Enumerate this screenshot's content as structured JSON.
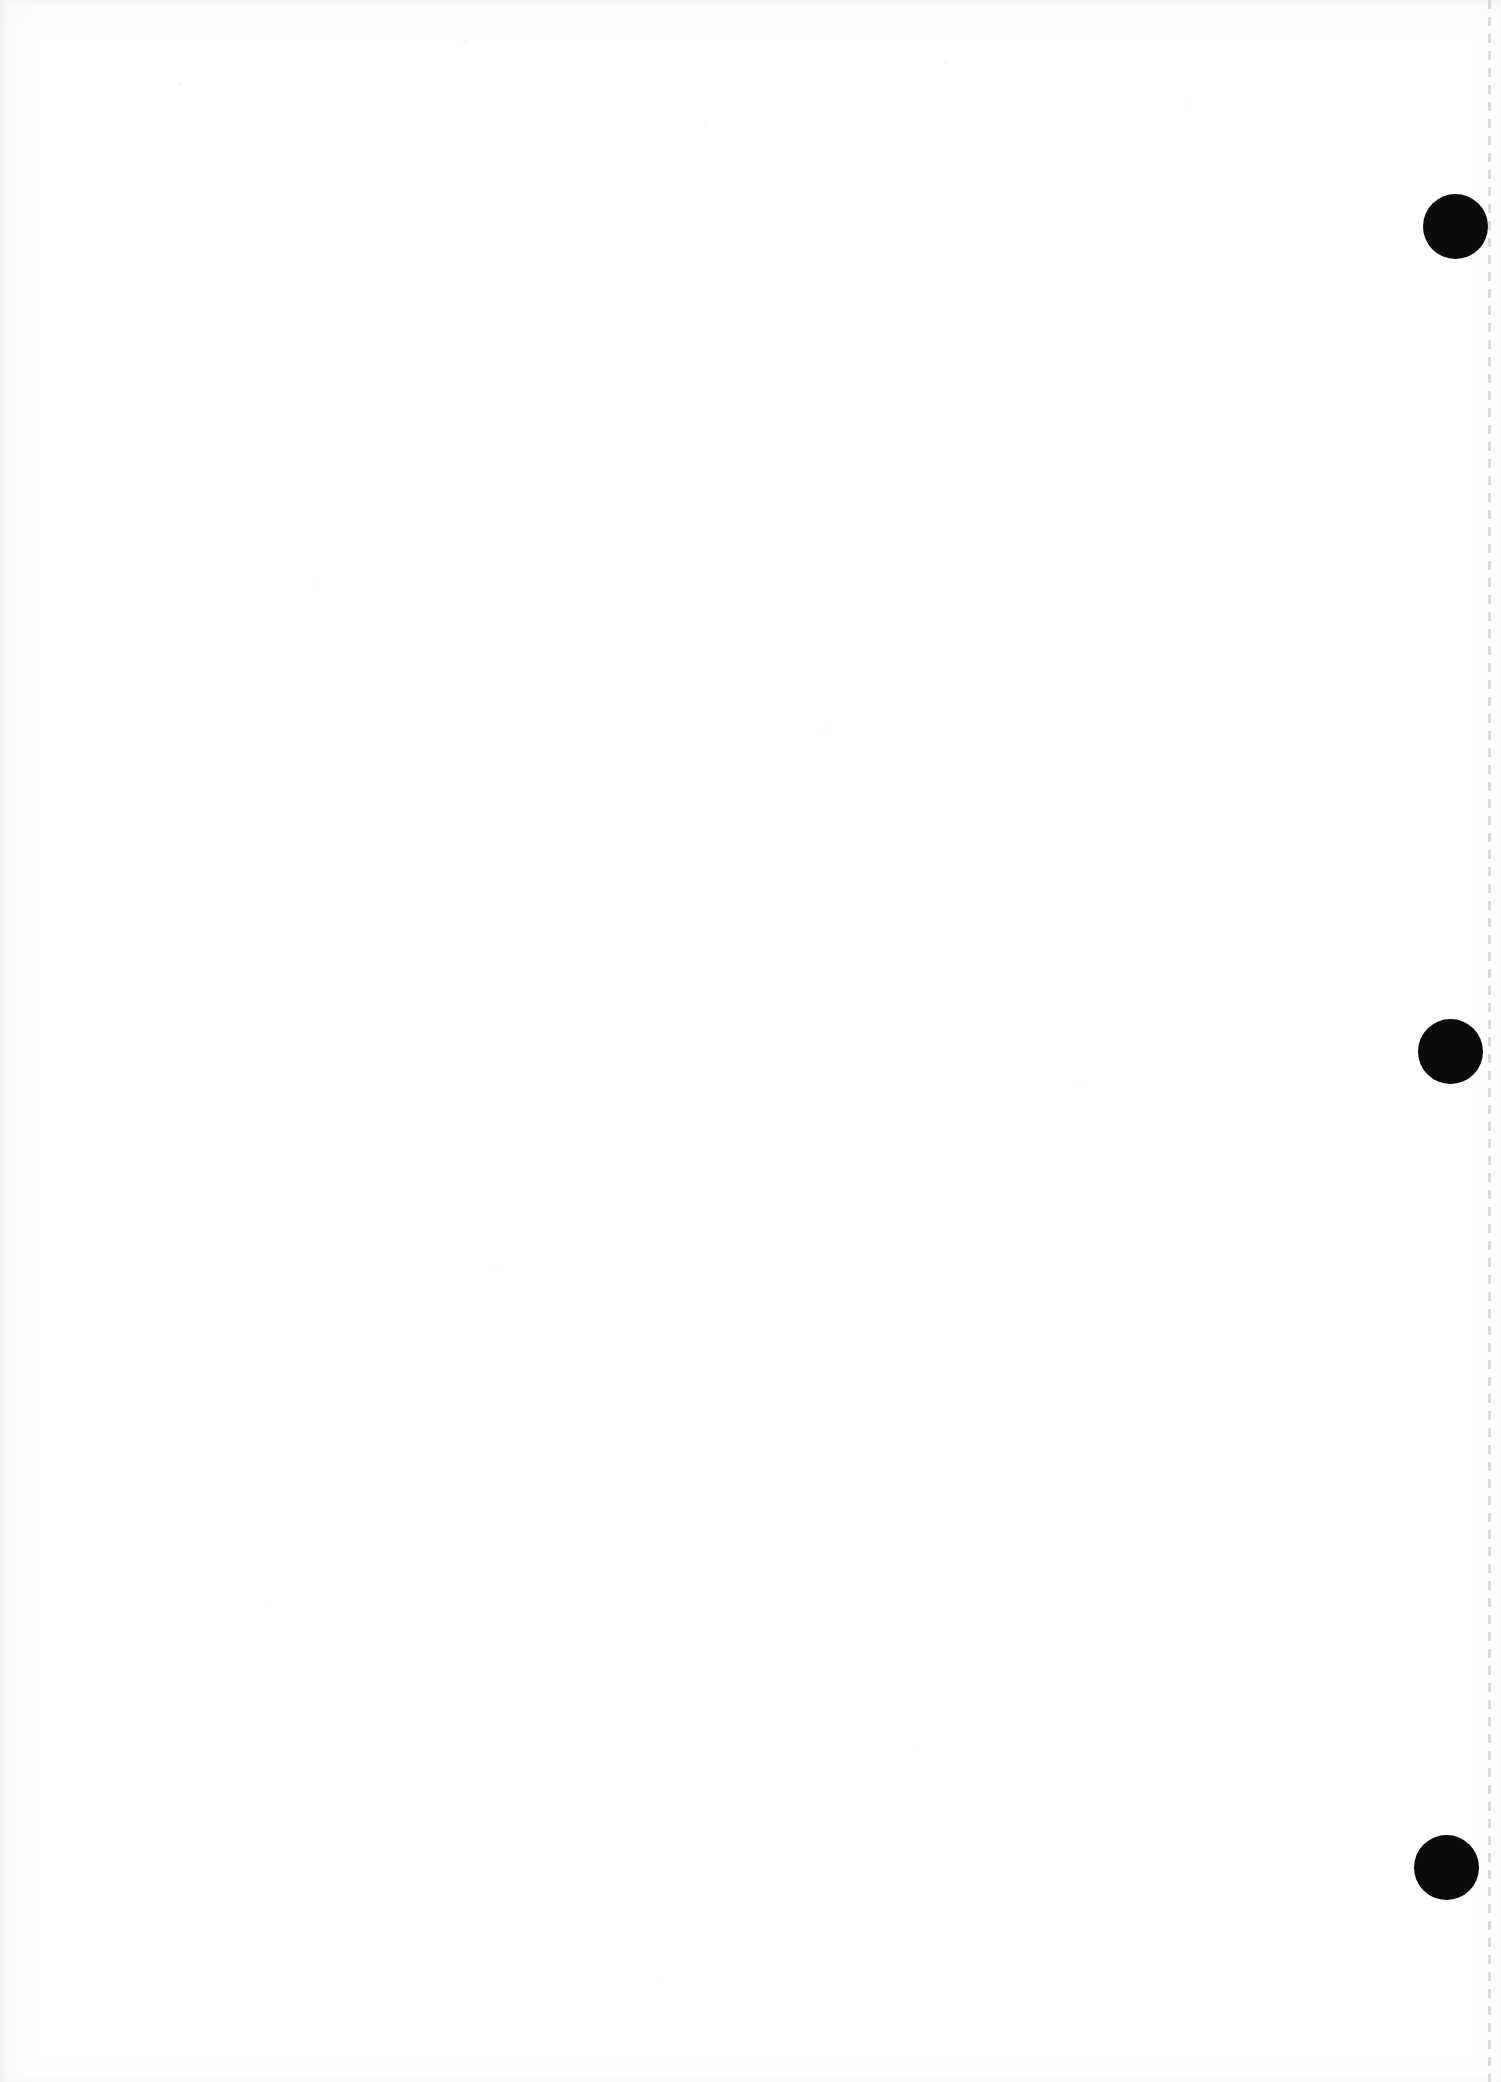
{
  "document": {
    "title": "Scanned blank page",
    "page_label": "",
    "body_text": "",
    "width_px": 1501,
    "height_px": 2082,
    "orientation": "portrait",
    "background_color": "#ffffff",
    "ink_color": "#0b0b0b"
  },
  "marks": {
    "name": "punch-holes",
    "description": "Three solid black circular marks along the right edge",
    "count": 3,
    "shape": "circle",
    "color": "#0b0b0b",
    "diameter_px": 65,
    "items": [
      {
        "id": "punch-mark-1",
        "center_x": 1455,
        "center_y": 226,
        "diameter": 65
      },
      {
        "id": "punch-mark-2",
        "center_x": 1450,
        "center_y": 1051,
        "diameter": 65
      },
      {
        "id": "punch-mark-3",
        "center_x": 1446,
        "center_y": 1867,
        "diameter": 65
      }
    ]
  },
  "margin_rule": {
    "name": "right-margin-dashed-rule",
    "orientation": "vertical",
    "x_px": 1488,
    "width_px": 3,
    "style": "dashed",
    "color": "#d6d9de",
    "top_px": 0,
    "bottom_px": 2082
  },
  "edges": {
    "name": "scan-edge-shading",
    "description": "Subtle gray shading along the scanned sheet edges",
    "color": "#eceef1"
  }
}
